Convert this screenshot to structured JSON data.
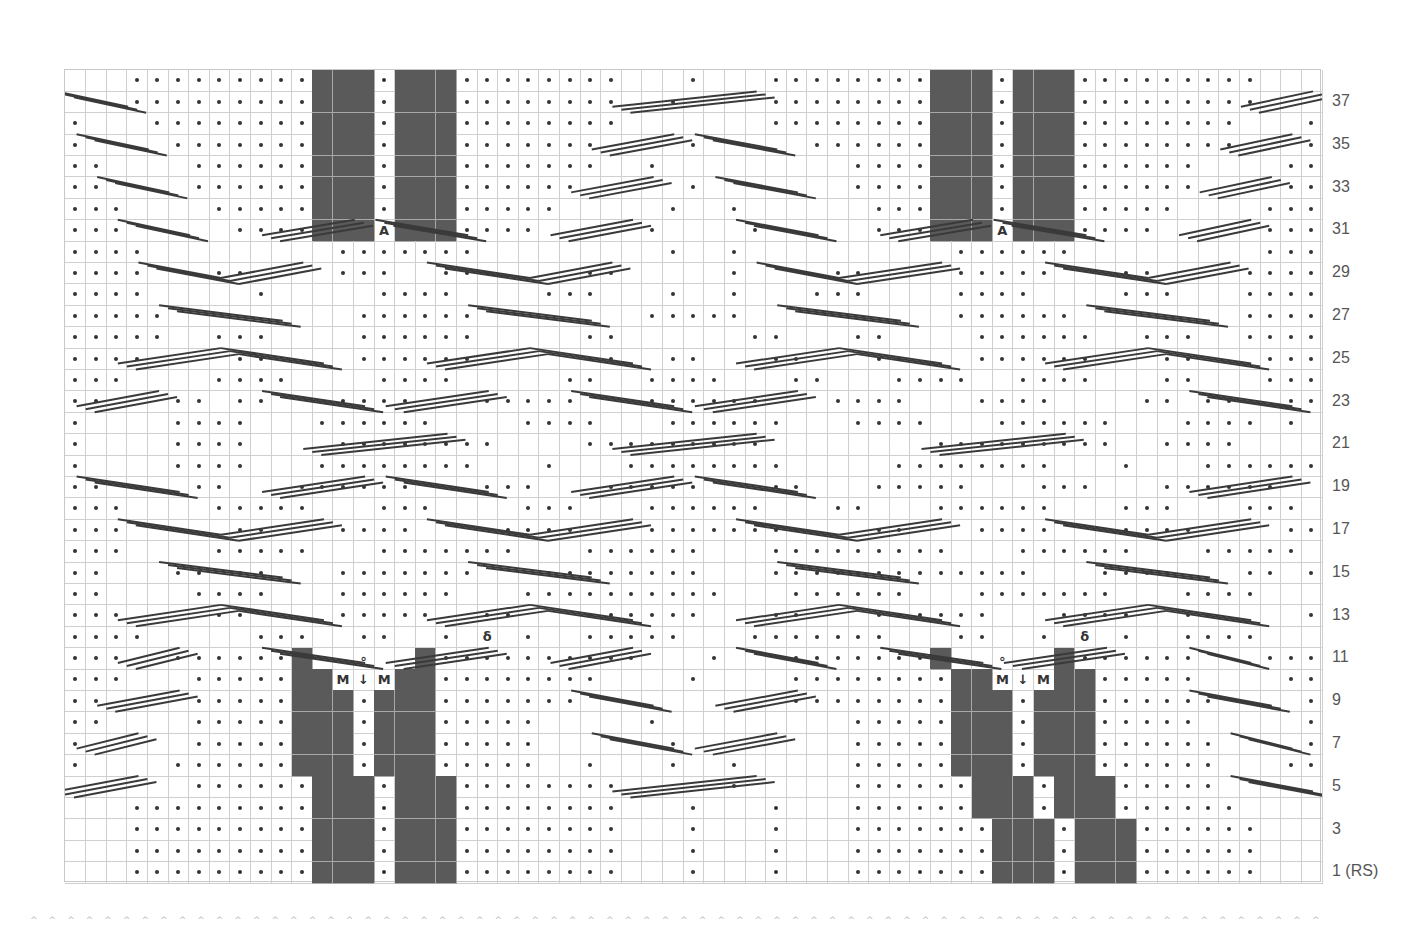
{
  "chart": {
    "cols": 61,
    "rows": 38,
    "cell_w": 20.607,
    "cell_h": 21.395,
    "colors": {
      "grid": "#cfcfcf",
      "dark": "#5a5a5a",
      "dot": "#333333",
      "cable": "#3a3a3a",
      "label": "#555555"
    },
    "legend_note": "rows listed top (row 38) to bottom (row 1). '.'=purl dot, ' '=knit (empty), '#'=no stitch (dark), 'M'=make one, 'V'=decrease, 'A'=increase, 'O'=yarn over, 'Q'=twisted st",
    "grid_rows": [
      "   .........###.###........   .   ........###.###.........   ",
      "   .........###.###........  .    ........###.###.........   ",
      ".   ........###.###........       ........###.###........   .",
      ".    .......###.###.......    .     ......###.###........   .",
      "..    ......###.###.......  .         ....###.###......    ..",
      "..    ......###.###......     .       ....###.###......    ..",
      "...    .....###.###.....     .  .      ...###.###.....    ...",
      "...     ....###A###....     .    .     ...###A###....     ...",
      "....         .......         .  .          ......         ....",
      "....   ..    ...  ...    ..     .    ..    .....   ..    .....",
      "....     .     ....    ...   .  .   ...    ....    ...   .....",
      ".....         ......        .....          ......        .....",
      ".....  ...    ......     ..      ..   ..    ......  ...  .....",
      "....    ..    ......     ..  ..   ..   ..   ......   ..   ....",
      "...    ....    ....     ..  ....   ..   ....  ....   ..   ...",
      "..   .. ..   ....   .....   ......   ....   ....    .. ..  ..",
      ".    ....   ......    ....   ......   ....   ......   .... . .",
      ".    ....    ........    .........        .........  ....    .",
      ".    ....   ........   .   ........     ........   .   ......  .",
      "..    ..   ......   ...   .....   ..   .....   ...   ......   ..",
      "...    .....   ...    ...   ......   ..   ......   ...   ...   ...",
      "...     ..   ....    ....   ........   ..   ....   ....    ..   ...",
      "...    .....   .......   ......   .........   ......   .....   ...",
      "..   .. ..   .......   ........   .............   ....   .. ..  ..",
      "..    ....   ......   ..........   ......   .......   ....    ..",
      "...    ..    .....  ..   ......   ..   ......   ....  ..    ...",
      "....     ...  ..  . Q .  .....   .......   ..  . Q .  ....    ....",
      "...  ......#  O  #..........   .   .......#  O  #......   ....",
      "...   .....##MVM##........    .    ........##MVM##.....    ..",
      "..    .....###.###.......          ........###.###......    ..",
      "..    .....###.###.....     .         .....###.###.....     ..",
      ".     .....###.###.....      .        .....###.###......    ..",
      ".    ......###.###.....  .   .  .     .....###.###......   ...",
      "      ......###.###........     .     ......###.###.....       ",
      "   .........###.###........   .   .   ......###.###......    ",
      "   .........###.###........   .   .   .......###.###......   ",
      "   .........###.###........   .   .   .......###.###......   ",
      "   .........###.###........   .   .   .......###.###......   "
    ],
    "row_labels": [
      {
        "row": 37,
        "text": "37"
      },
      {
        "row": 35,
        "text": "35"
      },
      {
        "row": 33,
        "text": "33"
      },
      {
        "row": 31,
        "text": "31"
      },
      {
        "row": 29,
        "text": "29"
      },
      {
        "row": 27,
        "text": "27"
      },
      {
        "row": 25,
        "text": "25"
      },
      {
        "row": 23,
        "text": "23"
      },
      {
        "row": 21,
        "text": "21"
      },
      {
        "row": 19,
        "text": "19"
      },
      {
        "row": 17,
        "text": "17"
      },
      {
        "row": 15,
        "text": "15"
      },
      {
        "row": 13,
        "text": "13"
      },
      {
        "row": 11,
        "text": "11"
      },
      {
        "row": 9,
        "text": "9"
      },
      {
        "row": 7,
        "text": "7"
      },
      {
        "row": 5,
        "text": "5"
      },
      {
        "row": 3,
        "text": "3"
      },
      {
        "row": 1,
        "text": "1 (RS)"
      }
    ],
    "cables": [
      {
        "row": 37,
        "x1": 0,
        "x2": 3.5,
        "dir": "down"
      },
      {
        "row": 35,
        "x1": 1,
        "x2": 4.5,
        "dir": "down"
      },
      {
        "row": 33,
        "x1": 2,
        "x2": 5.5,
        "dir": "down"
      },
      {
        "row": 31,
        "x1": 3,
        "x2": 6.5,
        "dir": "down"
      },
      {
        "row": 31,
        "x1": 10,
        "x2": 14.5,
        "dir": "up"
      },
      {
        "row": 31,
        "x1": 15.5,
        "x2": 20,
        "dir": "down"
      },
      {
        "row": 29,
        "x1": 4,
        "x2": 8,
        "dir": "down"
      },
      {
        "row": 29,
        "x1": 8,
        "x2": 12,
        "dir": "up"
      },
      {
        "row": 27,
        "x1": 5,
        "x2": 11,
        "dir": "down"
      },
      {
        "row": 25,
        "x1": 3,
        "x2": 8,
        "dir": "up"
      },
      {
        "row": 25,
        "x1": 8,
        "x2": 13,
        "dir": "down"
      },
      {
        "row": 23,
        "x1": 1,
        "x2": 5,
        "dir": "up"
      },
      {
        "row": 23,
        "x1": 10,
        "x2": 15,
        "dir": "down"
      },
      {
        "row": 23,
        "x1": 16,
        "x2": 21,
        "dir": "up"
      },
      {
        "row": 21,
        "x1": 12,
        "x2": 19,
        "dir": "up"
      },
      {
        "row": 19,
        "x1": 1,
        "x2": 6,
        "dir": "down"
      },
      {
        "row": 19,
        "x1": 10,
        "x2": 15,
        "dir": "up"
      },
      {
        "row": 19,
        "x1": 16,
        "x2": 21,
        "dir": "down"
      },
      {
        "row": 17,
        "x1": 3,
        "x2": 8,
        "dir": "down"
      },
      {
        "row": 17,
        "x1": 8,
        "x2": 13,
        "dir": "up"
      },
      {
        "row": 15,
        "x1": 5,
        "x2": 11,
        "dir": "down"
      },
      {
        "row": 13,
        "x1": 3,
        "x2": 8,
        "dir": "up"
      },
      {
        "row": 13,
        "x1": 8,
        "x2": 13,
        "dir": "down"
      },
      {
        "row": 11,
        "x1": 3,
        "x2": 6,
        "dir": "up"
      },
      {
        "row": 11,
        "x1": 10,
        "x2": 15,
        "dir": "down"
      },
      {
        "row": 11,
        "x1": 16,
        "x2": 21,
        "dir": "up"
      },
      {
        "row": 9,
        "x1": 2,
        "x2": 6,
        "dir": "up"
      },
      {
        "row": 7,
        "x1": 1,
        "x2": 4,
        "dir": "up"
      },
      {
        "row": 5,
        "x1": 0,
        "x2": 4,
        "dir": "up"
      },
      {
        "row": 37,
        "x1": 27,
        "x2": 34,
        "dir": "up"
      },
      {
        "row": 35,
        "x1": 26,
        "x2": 30,
        "dir": "up"
      },
      {
        "row": 35,
        "x1": 31,
        "x2": 35,
        "dir": "down"
      },
      {
        "row": 33,
        "x1": 25,
        "x2": 29,
        "dir": "up"
      },
      {
        "row": 33,
        "x1": 32,
        "x2": 36,
        "dir": "down"
      },
      {
        "row": 31,
        "x1": 24,
        "x2": 28,
        "dir": "up"
      },
      {
        "row": 31,
        "x1": 33,
        "x2": 37,
        "dir": "down"
      },
      {
        "row": 31,
        "x1": 40,
        "x2": 44.5,
        "dir": "up"
      },
      {
        "row": 31,
        "x1": 45.5,
        "x2": 50,
        "dir": "down"
      },
      {
        "row": 29,
        "x1": 18,
        "x2": 23,
        "dir": "down"
      },
      {
        "row": 29,
        "x1": 23,
        "x2": 27,
        "dir": "up"
      },
      {
        "row": 29,
        "x1": 34,
        "x2": 38,
        "dir": "down"
      },
      {
        "row": 29,
        "x1": 38,
        "x2": 43,
        "dir": "up"
      },
      {
        "row": 27,
        "x1": 20,
        "x2": 26,
        "dir": "down"
      },
      {
        "row": 27,
        "x1": 35,
        "x2": 41,
        "dir": "down"
      },
      {
        "row": 25,
        "x1": 18,
        "x2": 23,
        "dir": "up"
      },
      {
        "row": 25,
        "x1": 23,
        "x2": 28,
        "dir": "down"
      },
      {
        "row": 25,
        "x1": 33,
        "x2": 38,
        "dir": "up"
      },
      {
        "row": 25,
        "x1": 38,
        "x2": 43,
        "dir": "down"
      },
      {
        "row": 23,
        "x1": 25,
        "x2": 30,
        "dir": "down"
      },
      {
        "row": 23,
        "x1": 31,
        "x2": 36,
        "dir": "up"
      },
      {
        "row": 21,
        "x1": 27,
        "x2": 34,
        "dir": "up"
      },
      {
        "row": 19,
        "x1": 25,
        "x2": 30,
        "dir": "up"
      },
      {
        "row": 19,
        "x1": 31,
        "x2": 36,
        "dir": "down"
      },
      {
        "row": 17,
        "x1": 18,
        "x2": 23,
        "dir": "down"
      },
      {
        "row": 17,
        "x1": 23,
        "x2": 28,
        "dir": "up"
      },
      {
        "row": 17,
        "x1": 33,
        "x2": 38,
        "dir": "down"
      },
      {
        "row": 17,
        "x1": 38,
        "x2": 43,
        "dir": "up"
      },
      {
        "row": 15,
        "x1": 20,
        "x2": 26,
        "dir": "down"
      },
      {
        "row": 15,
        "x1": 35,
        "x2": 41,
        "dir": "down"
      },
      {
        "row": 13,
        "x1": 18,
        "x2": 23,
        "dir": "up"
      },
      {
        "row": 13,
        "x1": 23,
        "x2": 28,
        "dir": "down"
      },
      {
        "row": 13,
        "x1": 33,
        "x2": 38,
        "dir": "up"
      },
      {
        "row": 13,
        "x1": 38,
        "x2": 43,
        "dir": "down"
      },
      {
        "row": 11,
        "x1": 24,
        "x2": 28,
        "dir": "up"
      },
      {
        "row": 11,
        "x1": 33,
        "x2": 37,
        "dir": "down"
      },
      {
        "row": 11,
        "x1": 40,
        "x2": 45,
        "dir": "down"
      },
      {
        "row": 11,
        "x1": 46,
        "x2": 51,
        "dir": "up"
      },
      {
        "row": 9,
        "x1": 25,
        "x2": 29,
        "dir": "down"
      },
      {
        "row": 9,
        "x1": 32,
        "x2": 36,
        "dir": "up"
      },
      {
        "row": 7,
        "x1": 26,
        "x2": 30,
        "dir": "down"
      },
      {
        "row": 7,
        "x1": 31,
        "x2": 35,
        "dir": "up"
      },
      {
        "row": 5,
        "x1": 27,
        "x2": 34,
        "dir": "up"
      },
      {
        "row": 37,
        "x1": 57.5,
        "x2": 61,
        "dir": "up"
      },
      {
        "row": 35,
        "x1": 56.5,
        "x2": 60,
        "dir": "up"
      },
      {
        "row": 33,
        "x1": 55.5,
        "x2": 59,
        "dir": "up"
      },
      {
        "row": 31,
        "x1": 54.5,
        "x2": 58,
        "dir": "up"
      },
      {
        "row": 29,
        "x1": 48,
        "x2": 53,
        "dir": "down"
      },
      {
        "row": 29,
        "x1": 53,
        "x2": 57,
        "dir": "up"
      },
      {
        "row": 27,
        "x1": 50,
        "x2": 56,
        "dir": "down"
      },
      {
        "row": 25,
        "x1": 48,
        "x2": 53,
        "dir": "up"
      },
      {
        "row": 25,
        "x1": 53,
        "x2": 58,
        "dir": "down"
      },
      {
        "row": 23,
        "x1": 55,
        "x2": 60,
        "dir": "down"
      },
      {
        "row": 21,
        "x1": 42,
        "x2": 49,
        "dir": "up"
      },
      {
        "row": 19,
        "x1": 55,
        "x2": 60,
        "dir": "up"
      },
      {
        "row": 17,
        "x1": 48,
        "x2": 53,
        "dir": "down"
      },
      {
        "row": 17,
        "x1": 53,
        "x2": 58,
        "dir": "up"
      },
      {
        "row": 15,
        "x1": 50,
        "x2": 56,
        "dir": "down"
      },
      {
        "row": 13,
        "x1": 48,
        "x2": 53,
        "dir": "up"
      },
      {
        "row": 13,
        "x1": 53,
        "x2": 58,
        "dir": "down"
      },
      {
        "row": 11,
        "x1": 55,
        "x2": 58,
        "dir": "down"
      },
      {
        "row": 9,
        "x1": 55,
        "x2": 59,
        "dir": "down"
      },
      {
        "row": 7,
        "x1": 57,
        "x2": 60,
        "dir": "down"
      },
      {
        "row": 5,
        "x1": 57,
        "x2": 61,
        "dir": "down"
      }
    ]
  },
  "footer": {
    "marks": 70,
    "glyph": "^"
  }
}
